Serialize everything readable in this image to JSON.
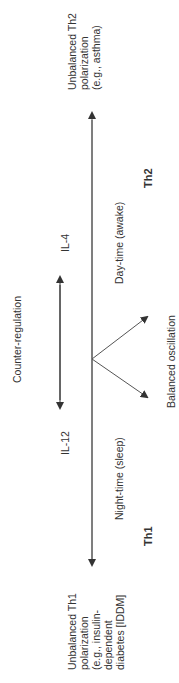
{
  "diagram": {
    "orientation": "rotated -90deg (reads bottom to top)",
    "top_label": [
      "Unbalanced Th2",
      "polarization",
      "(e.g., asthma)"
    ],
    "bottom_label": [
      "Unbalanced Th1",
      "polarization",
      "(e.g., insulin-",
      "dependent",
      "diabetes [IDDM]"
    ],
    "counter_regulation": "Counter-regulation",
    "il4": "IL-4",
    "il12": "IL-12",
    "day_time": "Day-time (awake)",
    "night_time": "Night-time (sleep)",
    "th2": "Th2",
    "th1": "Th1",
    "balanced": "Balanced oscillation",
    "colors": {
      "line": "#444444",
      "text": "#333333"
    }
  }
}
